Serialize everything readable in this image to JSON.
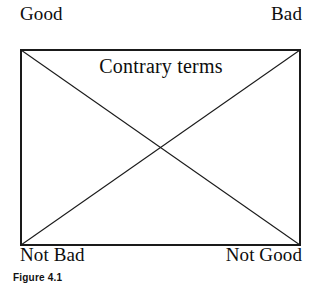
{
  "figure": {
    "caption": "Figure 4.1",
    "inner_label": "Contrary terms",
    "corners": {
      "top_left": "Good",
      "top_right": "Bad",
      "bottom_left": "Not Bad",
      "bottom_right": "Not Good"
    },
    "colors": {
      "background": "#ffffff",
      "stroke": "#1a1a1a",
      "text": "#0d0d0d",
      "caption_text": "#111111"
    },
    "geometry": {
      "rect_left": 21,
      "rect_top": 50,
      "rect_right": 300,
      "rect_bottom": 245,
      "center_x": 160.5,
      "center_y": 147.5,
      "stroke_width": 1.1
    },
    "shapes": [
      "rectangle-border",
      "diagonal-top-left-to-bottom-right",
      "diagonal-top-right-to-bottom-left"
    ]
  }
}
